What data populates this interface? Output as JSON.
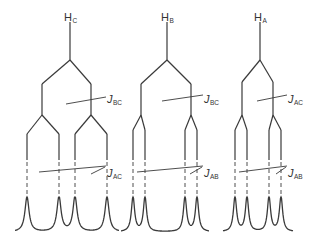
{
  "diagram": {
    "title": "",
    "line_color": "#3a3a3a",
    "trees": [
      {
        "id": "HC",
        "label": {
          "main": "H",
          "sub": "C",
          "x": 64,
          "y": 8
        },
        "stem": {
          "x": 70,
          "y1": 22,
          "y2": 60
        },
        "level1": {
          "split_y": 60,
          "land_y": 84,
          "xs": [
            42,
            91
          ],
          "drop_to": 115
        },
        "level2": {
          "split_y": 115,
          "land_y": 134,
          "groups": [
            {
              "parent": 42,
              "xs": [
                27,
                59
              ]
            },
            {
              "parent": 91,
              "xs": [
                75,
                107
              ]
            }
          ],
          "solid_to": 160,
          "dashed_to": 198
        },
        "peaks": {
          "xs": [
            27,
            59,
            75,
            107
          ],
          "top": 197,
          "base": 232,
          "width": 9
        },
        "j_labels": [
          {
            "id": "JBC",
            "main": "J",
            "sub": "BC",
            "x": 107,
            "y": 90,
            "leader": {
              "x1": 66,
              "y1": 104,
              "x2": 106,
              "y2": 97
            }
          },
          {
            "id": "JAC",
            "main": "J",
            "sub": "AC",
            "x": 107,
            "y": 164,
            "leader": {
              "x1": 39,
              "y1": 172,
              "x2": 106,
              "y2": 166
            },
            "tick": {
              "x1": 91,
              "y1": 174,
              "x2": 105,
              "y2": 167
            }
          }
        ]
      },
      {
        "id": "HB",
        "label": {
          "main": "H",
          "sub": "B",
          "x": 161,
          "y": 8
        },
        "stem": {
          "x": 167,
          "y1": 22,
          "y2": 60
        },
        "level1": {
          "split_y": 60,
          "land_y": 84,
          "xs": [
            141,
            191
          ],
          "drop_to": 115
        },
        "level2": {
          "split_y": 115,
          "land_y": 130,
          "groups": [
            {
              "parent": 141,
              "xs": [
                133,
                145
              ]
            },
            {
              "parent": 191,
              "xs": [
                185,
                197
              ]
            }
          ],
          "solid_to": 160,
          "dashed_to": 198
        },
        "peaks": {
          "xs": [
            133,
            145,
            185,
            197
          ],
          "top": 197,
          "base": 232,
          "width": 7
        },
        "j_labels": [
          {
            "id": "JBC",
            "main": "J",
            "sub": "BC",
            "x": 204,
            "y": 90,
            "leader": {
              "x1": 162,
              "y1": 101,
              "x2": 203,
              "y2": 95
            }
          },
          {
            "id": "JAB",
            "main": "J",
            "sub": "AB",
            "x": 204,
            "y": 164,
            "leader": {
              "x1": 137,
              "y1": 172,
              "x2": 203,
              "y2": 166
            },
            "tick": {
              "x1": 190,
              "y1": 174,
              "x2": 202,
              "y2": 167
            }
          }
        ]
      },
      {
        "id": "HA",
        "label": {
          "main": "H",
          "sub": "A",
          "x": 254,
          "y": 8
        },
        "stem": {
          "x": 260,
          "y1": 22,
          "y2": 60
        },
        "level1": {
          "split_y": 60,
          "land_y": 82,
          "xs": [
            242,
            273
          ],
          "drop_to": 115
        },
        "level2": {
          "split_y": 115,
          "land_y": 130,
          "groups": [
            {
              "parent": 242,
              "xs": [
                235,
                247
              ]
            },
            {
              "parent": 273,
              "xs": [
                269,
                281
              ]
            }
          ],
          "solid_to": 160,
          "dashed_to": 198
        },
        "peaks": {
          "xs": [
            235,
            247,
            269,
            281
          ],
          "top": 197,
          "base": 232,
          "width": 7
        },
        "j_labels": [
          {
            "id": "JAC",
            "main": "J",
            "sub": "AC",
            "x": 288,
            "y": 90,
            "leader": {
              "x1": 257,
              "y1": 101,
              "x2": 287,
              "y2": 95
            }
          },
          {
            "id": "JAB",
            "main": "J",
            "sub": "AB",
            "x": 288,
            "y": 164,
            "leader": {
              "x1": 239,
              "y1": 172,
              "x2": 287,
              "y2": 166
            },
            "tick": {
              "x1": 276,
              "y1": 174,
              "x2": 286,
              "y2": 167
            }
          }
        ]
      }
    ]
  }
}
